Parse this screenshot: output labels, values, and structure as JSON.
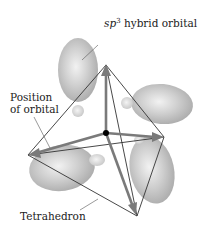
{
  "figure": {
    "labels": {
      "sp3_prefix": "sp",
      "sp3_sup": "3",
      "sp3_suffix": " hybrid orbital",
      "position_line1": "Position",
      "position_line2": "of orbital",
      "tetrahedron": "Tetrahedron"
    },
    "colors": {
      "orbital_fill": "#c8c8c8",
      "orbital_highlight": "#f0f0f0",
      "arrow": "#777777",
      "edge": "#333333",
      "nucleus": "#000000"
    }
  }
}
